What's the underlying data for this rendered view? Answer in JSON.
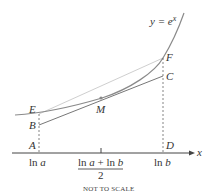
{
  "diagram": {
    "curve_label": "y = e",
    "curve_label_exp": "x",
    "axis_label": "x",
    "points": {
      "A": "A",
      "B": "B",
      "C": "C",
      "D": "D",
      "E": "E",
      "F": "F",
      "M": "M"
    },
    "ticks": {
      "ln_a_prefix": "ln ",
      "ln_a_var": "a",
      "ln_b_prefix": "ln ",
      "ln_b_var": "b",
      "mid_numerator_1": "ln ",
      "mid_numerator_a": "a",
      "mid_numerator_plus": " + ln ",
      "mid_numerator_b": "b",
      "mid_denominator": "2"
    },
    "note": "NOT TO SCALE",
    "colors": {
      "curve": "#8a8a8a",
      "tangent": "#777777",
      "chord": "#cccccc",
      "axis": "#444444",
      "dashed": "#666666"
    }
  }
}
